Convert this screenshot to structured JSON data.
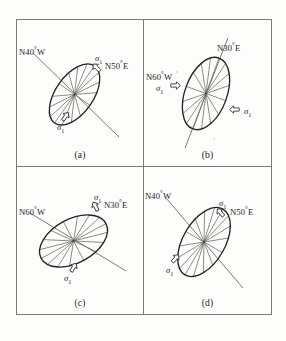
{
  "figure": {
    "type": "geology-stress-ellipse-figure",
    "panel_count": 4,
    "stroke_color": "#2b2b2b",
    "frame_color": "#7a7a78",
    "background": "#fdfdfc"
  },
  "panels": [
    {
      "id": "a",
      "caption": "(a)",
      "left_label": "N40",
      "left_label_deg": "°",
      "left_label_tail": "W",
      "left_label_full": "N40°W",
      "right_label": "N50",
      "right_label_deg": "°",
      "right_label_tail": "E",
      "right_label_full": "N50°E",
      "stress_symbol_upper": "σ",
      "stress_sub_upper": "1",
      "stress_symbol_lower": "σ",
      "stress_sub_lower": "1",
      "ellipse": {
        "cx": 58,
        "cy": 75,
        "rx": 19,
        "ry": 35,
        "rotation_deg": 35,
        "spokes": 8
      },
      "axis_line": {
        "angle_deg": 35,
        "length": 110
      },
      "arrow_upper_dir": "up-left",
      "arrow_lower_dir": "up-right"
    },
    {
      "id": "b",
      "caption": "(b)",
      "left_label": "N60",
      "left_label_deg": "°",
      "left_label_tail": "W",
      "left_label_full": "N60°W",
      "right_label": "N30",
      "right_label_deg": "°",
      "right_label_tail": "E",
      "right_label_full": "N30°E",
      "stress_symbol_upper": "σ",
      "stress_sub_upper": "1",
      "stress_symbol_lower": "σ",
      "stress_sub_lower": "1",
      "ellipse": {
        "cx": 62,
        "cy": 74,
        "rx": 21,
        "ry": 38,
        "rotation_deg": 20,
        "spokes": 8
      },
      "axis_line": {
        "angle_deg": 20,
        "length": 118
      },
      "arrow_upper_dir": "right",
      "arrow_lower_dir": "left"
    },
    {
      "id": "c",
      "caption": "(c)",
      "left_label": "N60",
      "left_label_deg": "°",
      "left_label_tail": "W",
      "left_label_full": "N60°W",
      "right_label": "N30",
      "right_label_deg": "°",
      "right_label_tail": "E",
      "right_label_full": "N30°E",
      "stress_symbol_upper": "σ",
      "stress_sub_upper": "1",
      "stress_symbol_lower": "σ",
      "stress_sub_lower": "1",
      "ellipse": {
        "cx": 57,
        "cy": 74,
        "rx": 22,
        "ry": 37,
        "rotation_deg": 62,
        "spokes": 8
      },
      "axis_line": {
        "angle_deg": 62,
        "length": 118
      },
      "arrow_upper_dir": "up-left",
      "arrow_lower_dir": "up-right"
    },
    {
      "id": "d",
      "caption": "(d)",
      "left_label": "N40",
      "left_label_deg": "°",
      "left_label_tail": "W",
      "left_label_full": "N40°W",
      "right_label": "N50",
      "right_label_deg": "°",
      "right_label_tail": "E",
      "right_label_full": "N50°E",
      "stress_symbol_upper": "σ",
      "stress_sub_upper": "1",
      "stress_symbol_lower": "σ",
      "stress_sub_lower": "1",
      "ellipse": {
        "cx": 60,
        "cy": 75,
        "rx": 21,
        "ry": 38,
        "rotation_deg": 30,
        "spokes": 8
      },
      "axis_line": {
        "angle_deg": 30,
        "length": 118
      },
      "arrow_upper_dir": "up-left",
      "arrow_lower_dir": "up-right"
    }
  ]
}
